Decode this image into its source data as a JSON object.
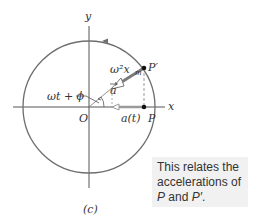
{
  "figure": {
    "panel_label": "(c)",
    "axes": {
      "x_label": "x",
      "y_label": "y",
      "origin_label": "O"
    },
    "points": {
      "p": "P",
      "p_prime": "P′"
    },
    "labels": {
      "magnitude": "ω²x",
      "magnitude_sub": "m",
      "vector": "a",
      "angle": "ωt + ϕ",
      "projection": "a(t)"
    },
    "colors": {
      "circle": "#6e6e6e",
      "vector": "#7a7a7a",
      "axis": "#555555"
    }
  },
  "caption": {
    "line1": "This relates the",
    "line2": "accelerations of",
    "p": "P",
    "and": " and ",
    "p_prime": "P′",
    "period": "."
  }
}
